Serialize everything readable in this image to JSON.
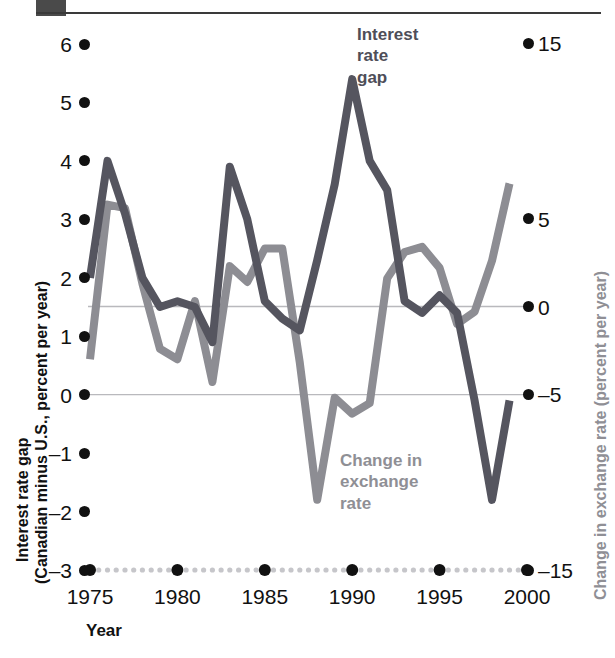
{
  "figure": {
    "top_rule": true,
    "corner_block": true
  },
  "chart_data": {
    "type": "line",
    "title": "",
    "subtitle": "",
    "xlabel": "Year",
    "ylabel": "Interest rate gap (Canadian minus U.S., percent per year)",
    "y2label": "Change in exchange rate (percent per year)",
    "xlim": [
      1975,
      1999.5
    ],
    "ylim": [
      -3,
      6
    ],
    "y2lim": [
      -15,
      15
    ],
    "grid": false,
    "gridlines": [
      {
        "axis": "y2",
        "value": 0,
        "label": "0"
      },
      {
        "axis": "y",
        "value": 0,
        "label": "0"
      }
    ],
    "legend_position": "inline-annotations",
    "xticks": [
      1975,
      1980,
      1985,
      1990,
      1995,
      2000
    ],
    "xticklabels": [
      "1975",
      "1980",
      "1985",
      "1990",
      "1995",
      "2000"
    ],
    "yticks": [
      6,
      5,
      4,
      3,
      2,
      1,
      0,
      -1,
      -2,
      -3
    ],
    "yticklabels": [
      "6",
      "5",
      "4",
      "3",
      "2",
      "1",
      "0",
      "–1",
      "–2",
      "–3"
    ],
    "y2ticks": [
      15,
      5,
      0,
      -5,
      -15
    ],
    "y2ticklabels": [
      "15",
      "5",
      "0",
      "–5",
      "–15"
    ],
    "x": [
      1975,
      1976,
      1977,
      1978,
      1979,
      1980,
      1981,
      1982,
      1983,
      1984,
      1985,
      1986,
      1987,
      1988,
      1989,
      1990,
      1991,
      1992,
      1993,
      1994,
      1995,
      1996,
      1997,
      1998,
      1999
    ],
    "series": [
      {
        "name": "Interest rate gap",
        "axis": "left",
        "color": "#55555f",
        "units": "percent per year",
        "values": [
          2.0,
          4.0,
          3.1,
          2.0,
          1.5,
          1.6,
          1.5,
          0.9,
          3.9,
          3.0,
          1.6,
          1.3,
          1.1,
          2.3,
          3.6,
          5.4,
          4.0,
          3.5,
          1.6,
          1.4,
          1.7,
          1.4,
          -0.1,
          -1.8,
          -0.1
        ]
      },
      {
        "name": "Change in exchange rate",
        "axis": "right",
        "color": "#8d8d93",
        "units": "percent per year",
        "values": [
          -3.0,
          5.8,
          5.6,
          1.3,
          -2.4,
          -3.0,
          0.3,
          -4.3,
          2.3,
          1.4,
          3.3,
          3.3,
          -3.2,
          -11.0,
          -5.2,
          -6.1,
          -5.5,
          1.6,
          3.1,
          3.4,
          2.2,
          -1.0,
          -0.3,
          2.6,
          7.0
        ]
      }
    ],
    "annotations": [
      {
        "text": "Interest rate gap",
        "series": "Interest rate gap",
        "color": "#4e4e58",
        "x_px": 355,
        "y_px": 30
      },
      {
        "text": "Change in exchange rate",
        "series": "Change in exchange rate",
        "color": "#8f8f95",
        "x_px": 338,
        "y_px": 455
      }
    ]
  },
  "annotations": {
    "interest_rate_gap": [
      "Interest",
      "rate",
      "gap"
    ],
    "change_in_exchange_rate": [
      "Change in",
      "exchange",
      "rate"
    ]
  },
  "axes": {
    "left_title_line1": "Interest rate gap",
    "left_title_line2": "(Canadian minus U.S., percent per year)",
    "right_title": "Change in exchange rate (percent per year)",
    "x_title": "Year"
  },
  "colors": {
    "dark_series": "#55555f",
    "light_series": "#8d8d93",
    "tick_dot": "#111111",
    "right_axis_text": "#8f8f95",
    "gridline": "#b9b9bd"
  }
}
